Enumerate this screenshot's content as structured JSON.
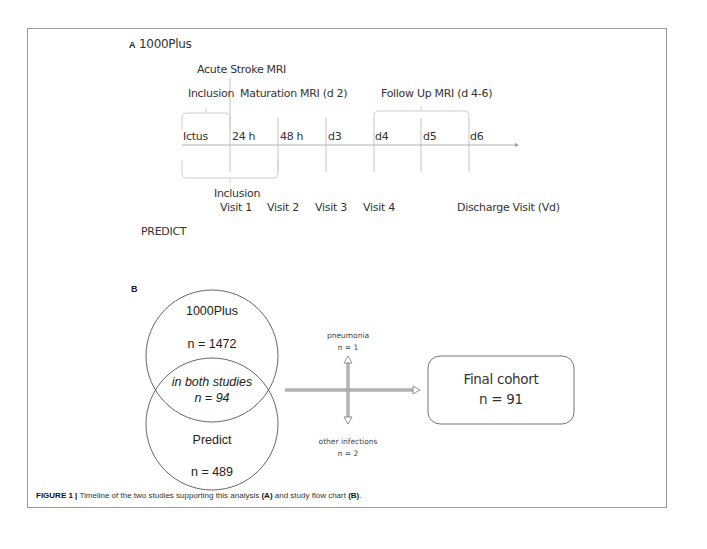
{
  "panel_a": {
    "label": "A",
    "study1_title": "1000Plus",
    "study2_title": "PREDICT",
    "top_labels": {
      "acute_mri": "Acute Stroke MRI",
      "inclusion": "Inclusion",
      "maturation_mri": "Maturation MRI (d 2)",
      "followup_mri": "Follow Up MRI (d 4-6)"
    },
    "timeline_ticks": [
      "Ictus",
      "24 h",
      "48 h",
      "d3",
      "d4",
      "d5",
      "d6"
    ],
    "bottom_labels": {
      "inclusion": "Inclusion",
      "visits": [
        "Visit 1",
        "Visit 2",
        "Visit 3",
        "Visit 4"
      ],
      "discharge": "Discharge Visit (Vd)"
    }
  },
  "panel_b": {
    "label": "B",
    "circle1": {
      "name": "1000Plus",
      "n": "n = 1472"
    },
    "overlap": {
      "name": "in both studies",
      "n": "n = 94"
    },
    "circle2": {
      "name": "Predict",
      "n": "n = 489"
    },
    "exclusion_up": {
      "name": "pneumonia",
      "n": "n = 1"
    },
    "exclusion_down": {
      "name": "other infections",
      "n": "n = 2"
    },
    "final": {
      "name": "Final cohort",
      "n": "n = 91"
    }
  },
  "caption": {
    "prefix": "FIGURE 1 |",
    "text1": " Timeline of the two studies supporting this analysis ",
    "ref_a": "(A)",
    "text2": " and study flow chart ",
    "ref_b": "(B)",
    "end": "."
  },
  "colors": {
    "line": "#8a8a8a",
    "bracket": "#c8c8c8",
    "frame": "#9a9a9a"
  }
}
